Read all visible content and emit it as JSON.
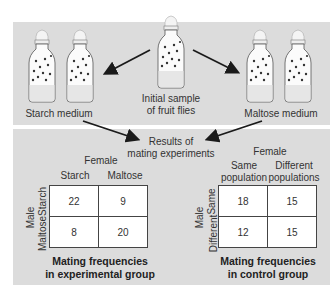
{
  "top": {
    "initial_label_line1": "Initial sample",
    "initial_label_line2": "of fruit flies",
    "starch_label": "Starch medium",
    "maltose_label": "Maltose medium"
  },
  "bottom": {
    "results_line1": "Results of",
    "results_line2": "mating experiments"
  },
  "experimental": {
    "female_header": "Female",
    "male_header": "Male",
    "col_headers": [
      "Starch",
      "Maltose"
    ],
    "row_headers": [
      "Starch",
      "Maltose"
    ],
    "cells": [
      [
        "22",
        "9"
      ],
      [
        "8",
        "20"
      ]
    ],
    "title_line1": "Mating frequencies",
    "title_line2": "in experimental group"
  },
  "control": {
    "female_header": "Female",
    "male_header": "Male",
    "col_headers": [
      "Same population",
      "Different populations"
    ],
    "col_header_lines": [
      [
        "Same",
        "population"
      ],
      [
        "Different",
        "populations"
      ]
    ],
    "row_headers": [
      "Same",
      "Different"
    ],
    "cells": [
      [
        "18",
        "15"
      ],
      [
        "12",
        "15"
      ]
    ],
    "title_line1": "Mating frequencies",
    "title_line2": "in control group"
  },
  "colors": {
    "panel": "#dcdcdc",
    "arrow": "#1a1a1a",
    "cell_bg": "#ffffff"
  }
}
